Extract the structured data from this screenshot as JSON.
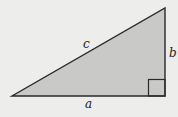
{
  "diagram": {
    "type": "right-triangle",
    "labels": {
      "hypotenuse": "c",
      "vertical_leg": "b",
      "horizontal_leg": "a"
    },
    "colors": {
      "background": "#ededeb",
      "fill": "#c9c9c7",
      "stroke": "#2a2a2a"
    }
  }
}
